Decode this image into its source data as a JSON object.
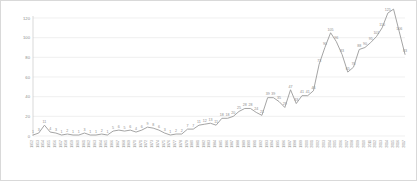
{
  "chart_data": {
    "type": "line",
    "title": "",
    "xlabel": "",
    "ylabel": "",
    "ylim": [
      0,
      120
    ],
    "yticks": [
      0,
      20,
      40,
      60,
      80,
      100,
      120
    ],
    "grid": true,
    "legend": false,
    "legend_position": "none",
    "show_data_labels": true,
    "line_color": "#9a9a9a",
    "grid_color": "#e6e6e6",
    "axis_color": "#c8c8c8",
    "label_color": "#8c8c8c",
    "categories": [
      "1952",
      "1953",
      "1954",
      "1955",
      "1956",
      "1957",
      "1958",
      "1959",
      "1960",
      "1961",
      "1962",
      "1963",
      "1964",
      "1965",
      "1966",
      "1967",
      "1968",
      "1969",
      "1970",
      "1971",
      "1972",
      "1973",
      "1974",
      "1975",
      "1976",
      "1977",
      "1978",
      "1979",
      "1980",
      "1981",
      "1982",
      "1983",
      "1984",
      "1985",
      "1986",
      "1987",
      "1988",
      "1989",
      "1990",
      "1991",
      "1992",
      "1993",
      "1994",
      "1995",
      "1996",
      "1997",
      "1998",
      "1999",
      "2000",
      "2001",
      "2002",
      "2003",
      "2004",
      "2005",
      "2006",
      "2007",
      "2008",
      "2009",
      "2010",
      "2011",
      "2012",
      "2013",
      "2014",
      "2015",
      "2016",
      "2017"
    ],
    "values": [
      1,
      3,
      11,
      4,
      3,
      1,
      2,
      1,
      1,
      3,
      1,
      1,
      2,
      1,
      5,
      6,
      5,
      6,
      4,
      6,
      9,
      8,
      6,
      3,
      1,
      2,
      2,
      7,
      7,
      11,
      12,
      13,
      11,
      18,
      18,
      20,
      25,
      28,
      28,
      24,
      21,
      39,
      39,
      35,
      29,
      47,
      33,
      41,
      41,
      46,
      73,
      90,
      105,
      96,
      83,
      65,
      70,
      88,
      90,
      95,
      101,
      110,
      125,
      129,
      106,
      83
    ]
  }
}
